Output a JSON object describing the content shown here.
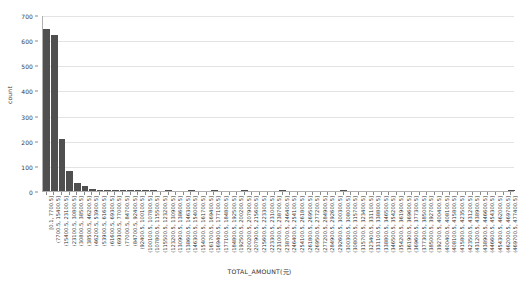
{
  "chart_data": {
    "type": "bar",
    "title": "",
    "subtitle": "",
    "xlabel": "TOTAL_AMOUNT(元)",
    "ylabel": "count",
    "ylim": [
      0,
      700
    ],
    "ytick_values": [
      0,
      100,
      200,
      300,
      400,
      500,
      600,
      700
    ],
    "ytick_labels": [
      "0",
      "100",
      "200",
      "300",
      "400",
      "500",
      "600",
      "700"
    ],
    "grid": "horizontal",
    "legend": null,
    "bar_color": "#4f4f4f",
    "bin_width": 7700,
    "categories": [
      "[0.1, 7700.5]",
      "(7700.5, 15400.5]",
      "(15400.5, 23100.5]",
      "(23100.5, 30800.5]",
      "(30800.5, 38500.5]",
      "(38500.5, 46200.5]",
      "(46200.5, 53900.5]",
      "(53900.5, 61600.5]",
      "(61600.5, 69300.5]",
      "(69300.5, 77000.5]",
      "(77000.5, 84700.5]",
      "(84700.5, 92400.5]",
      "(92400.5, 100100.5]",
      "(100100.5, 107800.5]",
      "(107800.5, 115500.5]",
      "(115500.5, 123200.5]",
      "(123200.5, 130900.5]",
      "(130900.5, 138600.5]",
      "(138600.5, 146300.5]",
      "(146300.5, 154000.5]",
      "(154000.5, 161700.5]",
      "(161700.5, 169400.5]",
      "(169400.5, 177100.5]",
      "(177100.5, 184800.5]",
      "(184800.5, 192500.5]",
      "(192500.5, 200200.5]",
      "(200200.5, 207900.5]",
      "(207900.5, 215600.5]",
      "(215600.5, 223300.5]",
      "(223300.5, 231000.5]",
      "(231000.5, 238700.5]",
      "(238700.5, 246400.5]",
      "(246400.5, 254100.5]",
      "(254100.5, 261800.5]",
      "(261800.5, 269500.5]",
      "(269500.5, 277200.5]",
      "(277200.5, 284900.5]",
      "(284900.5, 292600.5]",
      "(292600.5, 300300.5]",
      "(300300.5, 308000.5]",
      "(308000.5, 315700.5]",
      "(315700.5, 323400.5]",
      "(323400.5, 331100.5]",
      "(331100.5, 338800.5]",
      "(338800.5, 346500.5]",
      "(346500.5, 354200.5]",
      "(354200.5, 361900.5]",
      "(361900.5, 369600.5]",
      "(369600.5, 377300.5]",
      "(377300.5, 385000.5]",
      "(385000.5, 392700.5]",
      "(392700.5, 400400.5]",
      "(400400.5, 408100.5]",
      "(408100.5, 415800.5]",
      "(415800.5, 423500.5]",
      "(423500.5, 431200.5]",
      "(431200.5, 438900.5]",
      "(438900.5, 446600.5]",
      "(446600.5, 454300.5]",
      "(454300.5, 462000.5]",
      "(462000.5, 469700.5]",
      "(469700.5, 477400.5]"
    ],
    "values": [
      645,
      620,
      205,
      80,
      30,
      18,
      8,
      5,
      3,
      2,
      2,
      1,
      1,
      1,
      1,
      0,
      1,
      0,
      0,
      1,
      0,
      0,
      1,
      0,
      0,
      0,
      1,
      0,
      0,
      0,
      0,
      1,
      0,
      0,
      0,
      0,
      0,
      0,
      0,
      1,
      0,
      0,
      0,
      0,
      0,
      0,
      0,
      0,
      0,
      0,
      0,
      0,
      0,
      0,
      0,
      0,
      0,
      0,
      0,
      0,
      0,
      1
    ]
  }
}
